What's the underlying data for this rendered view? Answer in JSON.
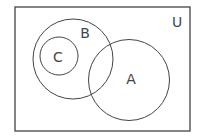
{
  "diagram": {
    "type": "venn",
    "universe": {
      "label": "U",
      "x": 15,
      "y": 7,
      "width": 175,
      "height": 124
    },
    "sets": [
      {
        "label": "B",
        "cx": 73,
        "cy": 59,
        "r": 40,
        "label_x": 85,
        "label_y": 38
      },
      {
        "label": "C",
        "cx": 59,
        "cy": 56,
        "r": 19,
        "label_x": 58,
        "label_y": 62,
        "subset_of": "B"
      },
      {
        "label": "A",
        "cx": 129,
        "cy": 80,
        "r": 40.5,
        "label_x": 131,
        "label_y": 84,
        "overlaps": "B"
      }
    ],
    "colors": {
      "stroke": "#444444",
      "background": "#ffffff"
    }
  },
  "labels": {
    "U": "U",
    "A": "A",
    "B": "B",
    "C": "C"
  }
}
